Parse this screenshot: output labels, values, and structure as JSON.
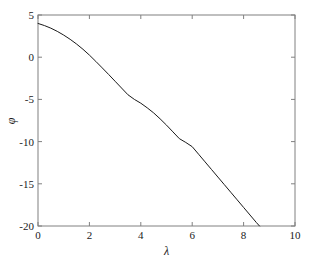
{
  "chart_data": {
    "type": "line",
    "title": "",
    "xlabel": "λ",
    "ylabel": "φ",
    "xlim": [
      0,
      10
    ],
    "ylim": [
      -20,
      5
    ],
    "xticks": [
      0,
      2,
      4,
      6,
      8,
      10
    ],
    "yticks": [
      5,
      0,
      -5,
      -10,
      -15,
      -20
    ],
    "xtick_labels": [
      "0",
      "2",
      "4",
      "6",
      "8",
      "10"
    ],
    "ytick_labels": [
      "5",
      "0",
      "-5",
      "-10",
      "-15",
      "-20"
    ],
    "grid": false,
    "legend": null,
    "box": true,
    "tick_direction": "in",
    "series": [
      {
        "name": "phi",
        "color": "#1a1a1a",
        "linewidth": 1,
        "x": [
          0.0,
          0.25,
          0.5,
          0.75,
          1.0,
          1.25,
          1.5,
          1.75,
          2.0,
          2.25,
          2.5,
          2.75,
          3.0,
          3.25,
          3.5,
          3.75,
          4.0,
          4.25,
          4.5,
          4.75,
          5.0,
          5.25,
          5.5,
          5.75,
          6.0,
          6.25,
          6.5,
          6.75,
          7.0,
          7.25,
          7.5,
          7.75,
          8.0,
          8.25,
          8.5,
          8.62
        ],
        "y": [
          4.0,
          3.75,
          3.44,
          3.06,
          2.62,
          2.12,
          1.56,
          0.94,
          0.25,
          -0.5,
          -1.27,
          -2.05,
          -2.85,
          -3.65,
          -4.45,
          -5.0,
          -5.45,
          -6.0,
          -6.6,
          -7.3,
          -8.05,
          -8.85,
          -9.65,
          -10.1,
          -10.6,
          -11.5,
          -12.4,
          -13.3,
          -14.2,
          -15.1,
          -16.0,
          -16.9,
          -17.8,
          -18.7,
          -19.6,
          -20.0
        ]
      }
    ],
    "annotations": []
  },
  "axes_geometry": {
    "left": 38,
    "right": 295,
    "top": 15,
    "bottom": 226,
    "tick_length": 4,
    "axis_color": "#808080",
    "background": "#ffffff"
  }
}
